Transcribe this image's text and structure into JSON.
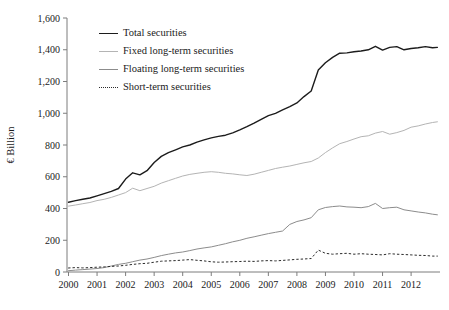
{
  "chart_data": {
    "type": "line",
    "title": "",
    "ylabel": "€ Billion",
    "xlabel": "",
    "grid": false,
    "legend_position": "upper-left-inside",
    "ylim": [
      0,
      1600
    ],
    "xlim": [
      2000,
      2013
    ],
    "yticks": {
      "values": [
        0,
        200,
        400,
        600,
        800,
        1000,
        1200,
        1400,
        1600
      ],
      "labels": [
        "0",
        "200",
        "400",
        "600",
        "800",
        "1,000",
        "1,200",
        "1,400",
        "1,600"
      ]
    },
    "xticks": {
      "values": [
        2000,
        2001,
        2002,
        2003,
        2004,
        2005,
        2006,
        2007,
        2008,
        2009,
        2010,
        2011,
        2012
      ],
      "labels": [
        "2000",
        "2001",
        "2002",
        "2003",
        "2004",
        "2005",
        "2006",
        "2007",
        "2008",
        "2009",
        "2010",
        "2011",
        "2012"
      ]
    },
    "x": [
      2000.0,
      2000.25,
      2000.5,
      2000.75,
      2001.0,
      2001.25,
      2001.5,
      2001.75,
      2002.0,
      2002.25,
      2002.5,
      2002.75,
      2003.0,
      2003.25,
      2003.5,
      2003.75,
      2004.0,
      2004.25,
      2004.5,
      2004.75,
      2005.0,
      2005.25,
      2005.5,
      2005.75,
      2006.0,
      2006.25,
      2006.5,
      2006.75,
      2007.0,
      2007.25,
      2007.5,
      2007.75,
      2008.0,
      2008.25,
      2008.5,
      2008.75,
      2009.0,
      2009.25,
      2009.5,
      2009.75,
      2010.0,
      2010.25,
      2010.5,
      2010.75,
      2011.0,
      2011.25,
      2011.5,
      2011.75,
      2012.0,
      2012.25,
      2012.5,
      2012.75,
      2012.92
    ],
    "series": [
      {
        "name": "Total securities",
        "color": "#1c1c1c",
        "width": 1.4,
        "dash": "",
        "values": [
          440,
          450,
          458,
          466,
          480,
          494,
          508,
          526,
          585,
          625,
          612,
          638,
          690,
          728,
          752,
          770,
          788,
          800,
          818,
          832,
          845,
          854,
          862,
          876,
          895,
          915,
          938,
          962,
          985,
          1000,
          1022,
          1042,
          1065,
          1105,
          1140,
          1272,
          1318,
          1352,
          1378,
          1380,
          1388,
          1392,
          1400,
          1422,
          1398,
          1415,
          1420,
          1400,
          1408,
          1412,
          1420,
          1412,
          1415
        ]
      },
      {
        "name": "Fixed long-term securities",
        "color": "#b4b4b4",
        "width": 1,
        "dash": "",
        "values": [
          415,
          422,
          430,
          438,
          450,
          458,
          470,
          485,
          500,
          528,
          512,
          526,
          540,
          560,
          575,
          590,
          605,
          615,
          622,
          628,
          632,
          628,
          622,
          618,
          612,
          608,
          616,
          628,
          640,
          652,
          660,
          668,
          678,
          688,
          696,
          718,
          752,
          782,
          808,
          822,
          838,
          852,
          858,
          875,
          885,
          868,
          878,
          892,
          912,
          920,
          932,
          942,
          946
        ]
      },
      {
        "name": "Floating long-term securities",
        "color": "#8c8c8c",
        "width": 1,
        "dash": "",
        "values": [
          8,
          12,
          15,
          18,
          22,
          28,
          38,
          48,
          55,
          65,
          75,
          82,
          92,
          103,
          112,
          120,
          126,
          135,
          145,
          152,
          158,
          168,
          178,
          190,
          200,
          212,
          222,
          232,
          242,
          250,
          258,
          300,
          318,
          328,
          342,
          392,
          406,
          412,
          416,
          410,
          408,
          405,
          412,
          432,
          400,
          405,
          408,
          392,
          385,
          378,
          372,
          364,
          360
        ]
      },
      {
        "name": "Short-term securities",
        "color": "#2b2b2b",
        "width": 1,
        "dash": "1.6 2.8",
        "values": [
          25,
          28,
          26,
          28,
          30,
          32,
          35,
          38,
          42,
          48,
          52,
          55,
          62,
          68,
          70,
          72,
          75,
          78,
          74,
          70,
          64,
          62,
          63,
          65,
          66,
          68,
          67,
          70,
          72,
          70,
          73,
          76,
          80,
          82,
          85,
          138,
          118,
          112,
          115,
          118,
          112,
          115,
          112,
          110,
          108,
          115,
          112,
          110,
          108,
          105,
          104,
          100,
          100
        ]
      }
    ]
  }
}
